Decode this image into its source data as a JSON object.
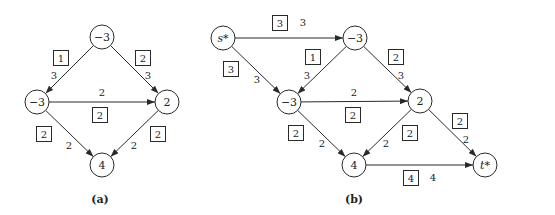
{
  "figure": {
    "width": 555,
    "height": 215,
    "node_radius": 12,
    "colors": {
      "stroke": "#2a2a2a",
      "text": "#222222",
      "background": "#ffffff"
    }
  },
  "panels": [
    {
      "id": "a",
      "caption": "(a)",
      "caption_pos": [
        100,
        203
      ],
      "nodes": [
        {
          "id": "a_top",
          "label": "−3",
          "x": 102,
          "y": 37,
          "italic": false
        },
        {
          "id": "a_left",
          "label": "−3",
          "x": 37,
          "y": 102,
          "italic": false
        },
        {
          "id": "a_right",
          "label": "2",
          "x": 167,
          "y": 102,
          "italic": false
        },
        {
          "id": "a_bottom",
          "label": "4",
          "x": 102,
          "y": 165,
          "italic": false
        }
      ],
      "edges": [
        {
          "from": "a_top",
          "to": "a_left",
          "capacity": "1",
          "cap_pos": [
            61,
            58
          ],
          "flow": "3",
          "flow_pos": [
            54,
            79
          ]
        },
        {
          "from": "a_top",
          "to": "a_right",
          "capacity": "2",
          "cap_pos": [
            143,
            58
          ],
          "flow": "3",
          "flow_pos": [
            148,
            79
          ]
        },
        {
          "from": "a_left",
          "to": "a_right",
          "capacity": "2",
          "cap_pos": [
            100,
            115
          ],
          "flow": "2",
          "flow_pos": [
            102,
            96
          ]
        },
        {
          "from": "a_left",
          "to": "a_bottom",
          "capacity": "2",
          "cap_pos": [
            44,
            134
          ],
          "flow": "2",
          "flow_pos": [
            69,
            149
          ]
        },
        {
          "from": "a_right",
          "to": "a_bottom",
          "capacity": "2",
          "cap_pos": [
            158,
            134
          ],
          "flow": "2",
          "flow_pos": [
            134,
            149
          ]
        }
      ]
    },
    {
      "id": "b",
      "caption": "(b)",
      "caption_pos": [
        354,
        203
      ],
      "nodes": [
        {
          "id": "b_s",
          "label": "s*",
          "x": 223,
          "y": 38,
          "italic": true
        },
        {
          "id": "b_top",
          "label": "−3",
          "x": 355,
          "y": 38,
          "italic": false
        },
        {
          "id": "b_left",
          "label": "−3",
          "x": 289,
          "y": 102,
          "italic": false
        },
        {
          "id": "b_right",
          "label": "2",
          "x": 420,
          "y": 101,
          "italic": false
        },
        {
          "id": "b_bottom",
          "label": "4",
          "x": 354,
          "y": 165,
          "italic": false
        },
        {
          "id": "b_t",
          "label": "t*",
          "x": 485,
          "y": 165,
          "italic": true
        }
      ],
      "edges": [
        {
          "from": "b_s",
          "to": "b_top",
          "capacity": "3",
          "cap_pos": [
            280,
            23
          ],
          "flow": "3",
          "flow_pos": [
            303,
            26
          ]
        },
        {
          "from": "b_s",
          "to": "b_left",
          "capacity": "3",
          "cap_pos": [
            231,
            69
          ],
          "flow": "3",
          "flow_pos": [
            257,
            83
          ]
        },
        {
          "from": "b_top",
          "to": "b_left",
          "capacity": "1",
          "cap_pos": [
            313,
            57
          ],
          "flow": "3",
          "flow_pos": [
            307,
            79
          ]
        },
        {
          "from": "b_top",
          "to": "b_right",
          "capacity": "2",
          "cap_pos": [
            396,
            57
          ],
          "flow": "3",
          "flow_pos": [
            401,
            79
          ]
        },
        {
          "from": "b_left",
          "to": "b_right",
          "capacity": "2",
          "cap_pos": [
            353,
            115
          ],
          "flow": "2",
          "flow_pos": [
            354,
            96
          ]
        },
        {
          "from": "b_left",
          "to": "b_bottom",
          "capacity": "2",
          "cap_pos": [
            296,
            133
          ],
          "flow": "2",
          "flow_pos": [
            322,
            147
          ]
        },
        {
          "from": "b_right",
          "to": "b_bottom",
          "capacity": "2",
          "cap_pos": [
            410,
            133
          ],
          "flow": "2",
          "flow_pos": [
            386,
            147
          ]
        },
        {
          "from": "b_right",
          "to": "b_t",
          "capacity": "2",
          "cap_pos": [
            460,
            121
          ],
          "flow": "2",
          "flow_pos": [
            466,
            143
          ]
        },
        {
          "from": "b_bottom",
          "to": "b_t",
          "capacity": "4",
          "cap_pos": [
            411,
            178
          ],
          "flow": "4",
          "flow_pos": [
            433,
            181
          ]
        }
      ]
    }
  ]
}
